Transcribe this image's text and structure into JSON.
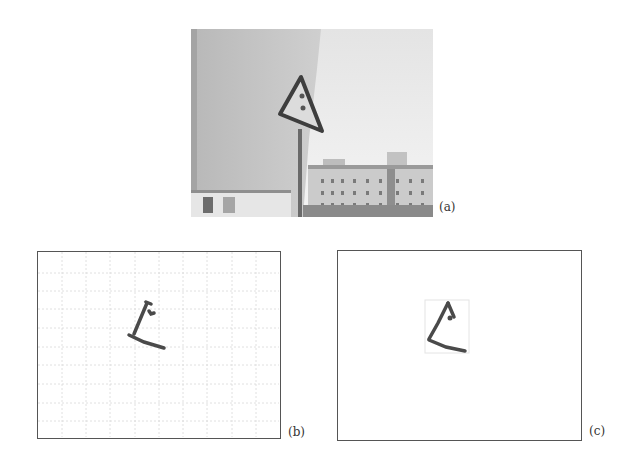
{
  "figure": {
    "panels": [
      {
        "id": "a",
        "label": "(a)",
        "kind": "photo",
        "description": "Street scene with triangular warning sign on pole, wall on left, apartment building bottom-right"
      },
      {
        "id": "b",
        "label": "(b)",
        "kind": "grid-detection",
        "description": "Extracted sign edge fragments over 10x10 grid",
        "grid": {
          "columns": 10,
          "rows": 10
        }
      },
      {
        "id": "c",
        "label": "(c)",
        "kind": "localized-region",
        "description": "Extracted sign edge fragments with bounding box"
      }
    ],
    "colors": {
      "frame": "#555555",
      "grid": "#d6d6d6",
      "stroke": "#4a4a4a",
      "bbox": "#e2e2e2"
    }
  }
}
